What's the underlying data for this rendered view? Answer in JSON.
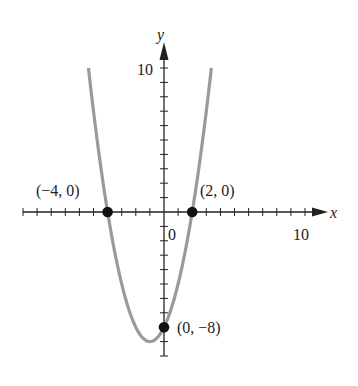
{
  "chart_data": {
    "type": "line",
    "title": "",
    "function": "y = x^2 + 2x - 8",
    "xlabel": "x",
    "ylabel": "y",
    "xlim": [
      -10,
      10
    ],
    "ylim": [
      -10,
      10
    ],
    "grid": false,
    "x_tick_step": 1,
    "y_tick_step": 1,
    "tick_labels": {
      "x": [
        "0",
        "10"
      ],
      "y": [
        "10"
      ]
    },
    "series": [
      {
        "name": "parabola",
        "color": "#9a9a9a",
        "x_range": [
          -5.36,
          3.36
        ],
        "vertex": [
          -1,
          -9
        ]
      }
    ],
    "points": [
      {
        "x": -4,
        "y": 0,
        "label": "(−4, 0)"
      },
      {
        "x": 2,
        "y": 0,
        "label": "(2, 0)"
      },
      {
        "x": 0,
        "y": -8,
        "label": "(0, −8)"
      }
    ]
  },
  "labels": {
    "x_axis": "x",
    "y_axis": "y",
    "origin": "0",
    "x_ten": "10",
    "y_ten": "10",
    "p1": "(−4, 0)",
    "p2": "(2, 0)",
    "p3": "(0, −8)"
  },
  "colors": {
    "curve": "#9a9a9a",
    "axis": "#222222",
    "point": "#111111"
  }
}
